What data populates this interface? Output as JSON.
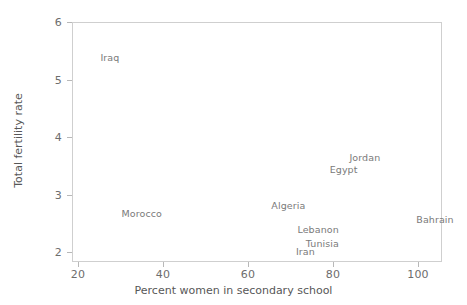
{
  "chart_data": {
    "type": "scatter",
    "title": "",
    "xlabel": "Percent women in secondary school",
    "ylabel": "Total fertility rate",
    "xlim": [
      18.5,
      106.5
    ],
    "ylim": [
      1.83,
      6.05
    ],
    "xticks": [
      20,
      40,
      60,
      80,
      100
    ],
    "yticks": [
      2,
      3,
      4,
      5,
      6
    ],
    "xtick_labels": [
      "20",
      "40",
      "60",
      "80",
      "100"
    ],
    "ytick_labels": [
      "2",
      "3",
      "4",
      "5",
      "6"
    ],
    "grid": false,
    "legend": "none",
    "marker_style": "text-label-only",
    "points": [
      {
        "label": "Iraq",
        "x": 27.5,
        "y": 5.4
      },
      {
        "label": "Morocco",
        "x": 35.0,
        "y": 2.68
      },
      {
        "label": "Algeria",
        "x": 69.5,
        "y": 2.82
      },
      {
        "label": "Egypt",
        "x": 82.5,
        "y": 3.44
      },
      {
        "label": "Jordan",
        "x": 87.5,
        "y": 3.65
      },
      {
        "label": "Lebanon",
        "x": 76.5,
        "y": 2.4
      },
      {
        "label": "Tunisia",
        "x": 77.5,
        "y": 2.16
      },
      {
        "label": "Iran",
        "x": 73.5,
        "y": 2.02
      },
      {
        "label": "Bahrain",
        "x": 104.0,
        "y": 2.57
      }
    ]
  },
  "axes": {
    "x_title": "Percent women in secondary school",
    "y_title": "Total fertility rate"
  },
  "colors": {
    "frame": "#cfcfcf",
    "tick": "#b8b8b8",
    "tick_text": "#6d6d6d",
    "axis_title": "#575757",
    "point_label": "#7a7a7a",
    "background": "#ffffff"
  }
}
